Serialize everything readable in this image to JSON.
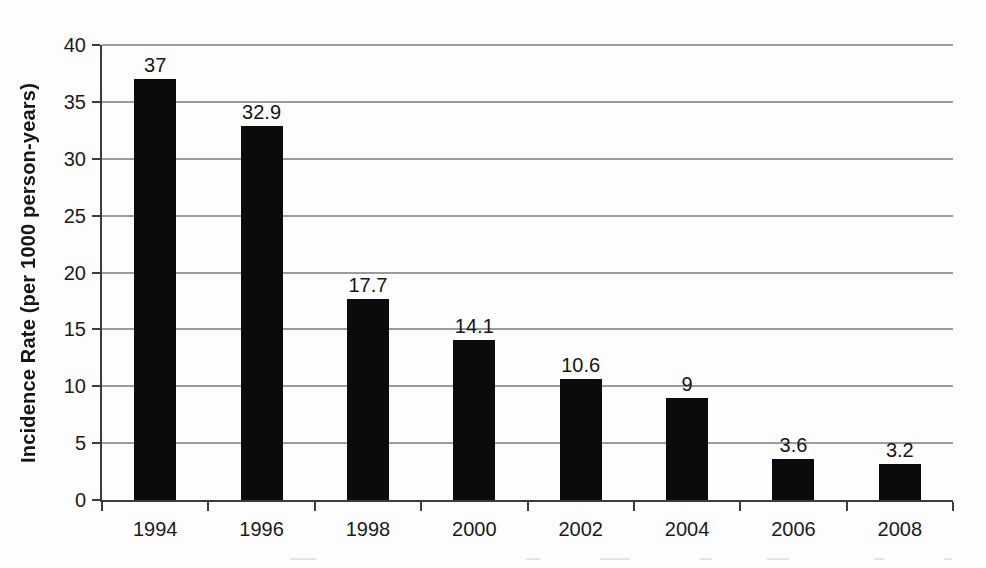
{
  "figure": {
    "y_axis": {
      "title": "Incidence Rate (per 1000 person-years)",
      "tick_labels": [
        "0",
        "5",
        "10",
        "15",
        "20",
        "25",
        "30",
        "35",
        "40"
      ]
    },
    "x_axis": {
      "tick_labels": [
        "1994",
        "1996",
        "1998",
        "2000",
        "2002",
        "2004",
        "2006",
        "2008"
      ]
    },
    "bar_value_labels": [
      "37",
      "32.9",
      "17.7",
      "14.1",
      "10.6",
      "9",
      "3.6",
      "3.2"
    ]
  },
  "chart_data": {
    "type": "bar",
    "title": "",
    "xlabel": "",
    "ylabel": "Incidence Rate (per 1000 person-years)",
    "categories": [
      "1994",
      "1996",
      "1998",
      "2000",
      "2002",
      "2004",
      "2006",
      "2008"
    ],
    "values": [
      37,
      32.9,
      17.7,
      14.1,
      10.6,
      9,
      3.6,
      3.2
    ],
    "data_labels": [
      "37",
      "32.9",
      "17.7",
      "14.1",
      "10.6",
      "9",
      "3.6",
      "3.2"
    ],
    "ylim": [
      0,
      40
    ],
    "yticks": [
      0,
      5,
      10,
      15,
      20,
      25,
      30,
      35,
      40
    ],
    "grid": "horizontal",
    "legend_position": "none",
    "data_labels_shown": true,
    "colors": {
      "bar": "#0b0b0b",
      "gridline": "#9b9b9b",
      "axis": "#3c3c3c",
      "text": "#1b1b1b",
      "background": "#fdfdfd"
    }
  }
}
